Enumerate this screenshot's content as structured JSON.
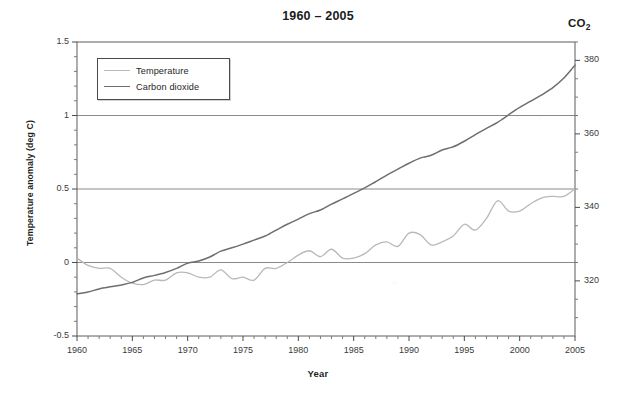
{
  "chart_data": {
    "type": "line",
    "title": "1960 – 2005",
    "xlabel": "Year",
    "ylabel": "Temperature anomaly (deg C)",
    "y2label": "CO2",
    "y2label_display": "CO",
    "y2label_sub": "2",
    "xlim": [
      1960,
      2005
    ],
    "ylim": [
      -0.5,
      1.5
    ],
    "y2lim": [
      305,
      385
    ],
    "grid": "horizontal gridlines at y = 0, 0.5, 1.0",
    "legend_position": "top-left inside plot area",
    "xticks": [
      "1960",
      "1965",
      "1970",
      "1975",
      "1980",
      "1985",
      "1990",
      "1995",
      "2000",
      "2005"
    ],
    "xtick_values": [
      1960,
      1965,
      1970,
      1975,
      1980,
      1985,
      1990,
      1995,
      2000,
      2005
    ],
    "yticks": [
      "-0.5",
      "0",
      "0.5",
      "1",
      "1.5"
    ],
    "ytick_values": [
      -0.5,
      0,
      0.5,
      1,
      1.5
    ],
    "y2ticks": [
      "320",
      "340",
      "360",
      "380"
    ],
    "y2tick_values": [
      320,
      340,
      360,
      380
    ],
    "x": [
      1960,
      1961,
      1962,
      1963,
      1964,
      1965,
      1966,
      1967,
      1968,
      1969,
      1970,
      1971,
      1972,
      1973,
      1974,
      1975,
      1976,
      1977,
      1978,
      1979,
      1980,
      1981,
      1982,
      1983,
      1984,
      1985,
      1986,
      1987,
      1988,
      1989,
      1990,
      1991,
      1992,
      1993,
      1994,
      1995,
      1996,
      1997,
      1998,
      1999,
      2000,
      2001,
      2002,
      2003,
      2004,
      2005
    ],
    "series": [
      {
        "name": "Temperature",
        "color": "#b9b9b9",
        "unit": "deg C",
        "axis": "left",
        "values": [
          0.03,
          -0.02,
          -0.04,
          -0.04,
          -0.1,
          -0.14,
          -0.15,
          -0.12,
          -0.12,
          -0.07,
          -0.07,
          -0.1,
          -0.1,
          -0.05,
          -0.11,
          -0.1,
          -0.12,
          -0.04,
          -0.04,
          0.0,
          0.05,
          0.08,
          0.04,
          0.09,
          0.03,
          0.03,
          0.06,
          0.12,
          0.14,
          0.11,
          0.2,
          0.19,
          0.12,
          0.14,
          0.18,
          0.26,
          0.22,
          0.3,
          0.42,
          0.35,
          0.35,
          0.4,
          0.44,
          0.45,
          0.45,
          0.5
        ]
      },
      {
        "name": "Carbon dioxide",
        "color": "#6e6e6e",
        "unit": "ppm",
        "axis": "right",
        "values": [
          316.5,
          317.0,
          317.8,
          318.4,
          318.9,
          319.6,
          320.8,
          321.5,
          322.3,
          323.4,
          324.8,
          325.4,
          326.5,
          328.1,
          329.0,
          330.0,
          331.1,
          332.2,
          333.8,
          335.4,
          336.8,
          338.3,
          339.3,
          340.9,
          342.3,
          343.8,
          345.3,
          347.0,
          348.8,
          350.4,
          352.0,
          353.4,
          354.2,
          355.6,
          356.5,
          358.0,
          359.8,
          361.5,
          363.1,
          365.2,
          367.2,
          368.9,
          370.6,
          372.6,
          375.2,
          378.7
        ]
      }
    ]
  },
  "legend": {
    "items": [
      {
        "label": "Temperature"
      },
      {
        "label": "Carbon dioxide"
      }
    ]
  }
}
